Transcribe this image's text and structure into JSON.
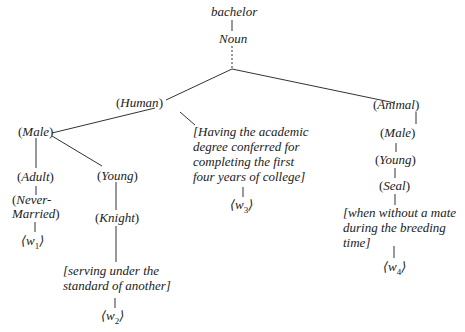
{
  "diagram": {
    "type": "semantic-tree",
    "root": {
      "word": "bachelor",
      "pos": "Noun"
    },
    "nodes": {
      "human": "Human",
      "male_left": "Male",
      "adult": "Adult",
      "never_married_1": "Never-",
      "never_married_2": "Married",
      "young_left": "Young",
      "knight": "Knight",
      "animal": "Animal",
      "male_right": "Male",
      "young_right": "Young",
      "seal": "Seal"
    },
    "glosses": {
      "knight_gloss": [
        "[serving under the",
        "standard of another]"
      ],
      "degree_gloss": [
        "[Having the academic",
        "degree conferred for",
        "completing the first",
        "four years of college]"
      ],
      "seal_gloss": [
        "[when without a mate",
        "during the breeding",
        "time]"
      ]
    },
    "senses": {
      "w1": {
        "base": "w",
        "sub": "1"
      },
      "w2": {
        "base": "w",
        "sub": "2"
      },
      "w3": {
        "base": "w",
        "sub": "3"
      },
      "w4": {
        "base": "w",
        "sub": "4"
      }
    }
  }
}
